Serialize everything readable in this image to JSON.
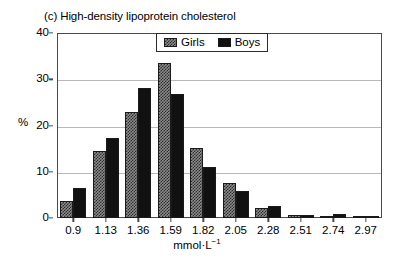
{
  "chart_data": {
    "type": "bar",
    "title": "(c) High-density lipoprotein cholesterol",
    "xlabel": "mmol",
    "xlabel_unit_base": "·L",
    "xlabel_unit_exp": "−1",
    "ylabel": "%",
    "categories": [
      "0.9",
      "1.13",
      "1.36",
      "1.59",
      "1.82",
      "2.05",
      "2.28",
      "2.51",
      "2.74",
      "2.97"
    ],
    "series": [
      {
        "name": "Girls",
        "values": [
          3.7,
          14.5,
          23.0,
          33.5,
          15.1,
          7.5,
          2.1,
          0.6,
          0.5,
          0.5
        ]
      },
      {
        "name": "Boys",
        "values": [
          6.5,
          17.3,
          28.1,
          26.8,
          11.0,
          5.9,
          2.6,
          0.7,
          0.9,
          0.4
        ]
      }
    ],
    "ylim": [
      0,
      40
    ],
    "yticks": [
      0,
      10,
      20,
      30,
      40
    ],
    "ytick_labels": [
      "0",
      "10",
      "20",
      "30",
      "40"
    ],
    "grid": true,
    "legend_position": "top-center",
    "colors": {
      "girls_fill": "#8c8c8c",
      "girls_hatch": "#2b2b2b",
      "boys_fill": "#111111",
      "axis": "#4a4a4a",
      "gridline": "#b9b9b9",
      "background": "#ffffff"
    }
  }
}
